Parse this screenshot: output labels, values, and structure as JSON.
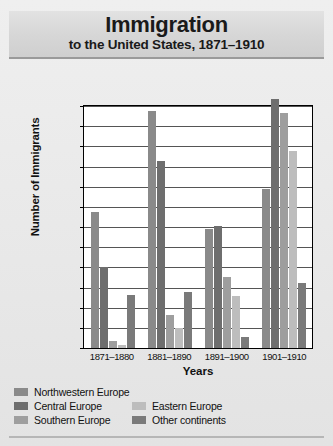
{
  "title": {
    "main": "Immigration",
    "sub": "to the United States, 1871–1910"
  },
  "chart_data": {
    "type": "bar",
    "title": "Immigration to the United States, 1871–1910",
    "xlabel": "Years",
    "ylabel": "Number of Immigrants",
    "categories": [
      "1871–1880",
      "1881–1890",
      "1891–1900",
      "1901–1910"
    ],
    "ylim": [
      0,
      2400000
    ],
    "ytick_step": 200000,
    "yticks": [
      "2,400,000",
      "2,200,000",
      "2,000,000",
      "1,800,000",
      "1,600,000",
      "1,400,000",
      "1,200,000",
      "1,000,000",
      "800,000",
      "600,000",
      "400,000",
      "200,000",
      "0"
    ],
    "ytick_values": [
      2400000,
      2200000,
      2000000,
      1800000,
      1600000,
      1400000,
      1200000,
      1000000,
      800000,
      600000,
      400000,
      200000,
      0
    ],
    "grid": true,
    "legend_position": "below",
    "series": [
      {
        "name": "Northwestern Europe",
        "color": "#8a8a8a",
        "values": [
          1350000,
          2350000,
          1180000,
          1580000
        ]
      },
      {
        "name": "Central Europe",
        "color": "#6e6e6e",
        "values": [
          800000,
          1850000,
          1210000,
          2470000
        ]
      },
      {
        "name": "Southern Europe",
        "color": "#9e9e9e",
        "values": [
          70000,
          330000,
          700000,
          2330000
        ]
      },
      {
        "name": "Eastern Europe",
        "color": "#bdbdbd",
        "values": [
          30000,
          200000,
          520000,
          1950000
        ]
      },
      {
        "name": "Other continents",
        "color": "#7a7a7a",
        "values": [
          530000,
          560000,
          110000,
          640000
        ]
      }
    ]
  },
  "legend": {
    "column_a": [
      "Northwestern Europe",
      "Central Europe",
      "Southern Europe"
    ],
    "column_b": [
      "Eastern Europe",
      "Other continents"
    ]
  },
  "colors": {
    "northwestern_europe": "#8a8a8a",
    "central_europe": "#6e6e6e",
    "southern_europe": "#9e9e9e",
    "eastern_europe": "#bdbdbd",
    "other_continents": "#7a7a7a",
    "plot_background": "#ffffff",
    "page_background": "#e9e9e9",
    "title_band": "#d6d6d6"
  }
}
